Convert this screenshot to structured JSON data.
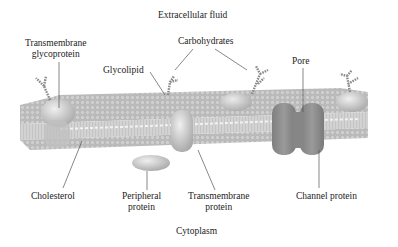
{
  "diagram": {
    "type": "cell-membrane",
    "colors": {
      "background": "#ffffff",
      "membrane": "#b5b5b5",
      "head_dark": "#9a9a9a",
      "protein": "#d6d6d6",
      "channel": "#8f8f8f",
      "leader_line": "#555555",
      "text": "#222222"
    },
    "regions": {
      "top": "Extracellular fluid",
      "bottom": "Cytoplasm"
    },
    "labels": {
      "transmembrane_glycoprotein": [
        "Transmembrane",
        "glycoprotein"
      ],
      "carbohydrates": "Carbohydrates",
      "glycolipid": "Glycolipid",
      "pore": "Pore",
      "cholesterol": "Cholesterol",
      "peripheral_protein": [
        "Peripheral",
        "protein"
      ],
      "transmembrane_protein": [
        "Transmembrane",
        "protein"
      ],
      "channel_protein": "Channel protein"
    }
  }
}
